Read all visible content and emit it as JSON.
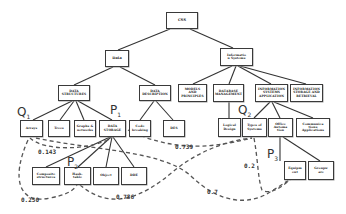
{
  "diagram": {
    "type": "taxonomy-tree-with-weighted-dashed-links",
    "nodes": {
      "root": "CSS",
      "data": "Data",
      "info_systems": "Informatio\nn Systems",
      "data_structures": "DATA\nSTRUCTURES",
      "data_description": "DATA\nDESCRIPTION",
      "models_principles": "MODELS\nAND\nPRINCIPLES",
      "database_mgmt": "DATABASE\nMANAGEMENT",
      "is_application": "INFORMATION\nSYSTEMS\nAPPLICATION",
      "is_storage": "INFORMATION\nSTORAGE AND\nRETRIEVAL",
      "arrays": "Arrays",
      "trees": "Trees",
      "graphs": "Graphs &\nnetworks",
      "data_storage": "DATA\nSTORAGE",
      "code_breaking": "Code\nbreaking",
      "des": "DES",
      "logical_design": "Logical\nDesign",
      "types_of_systems": "Types of\nSystems",
      "office_automation": "Office\nAutoma\ntion",
      "communications_apps": "Communica\ntions\nApplications",
      "composite": "Composite\nstructures",
      "hash_table": "Hash-\ntable",
      "object": "Object",
      "dde": "DDE",
      "equipment": "Equipm\nent",
      "groupware": "Groupw\nare"
    },
    "markers": {
      "q1": {
        "letter": "Q",
        "sub": "1"
      },
      "p1": {
        "letter": "P",
        "sub": "1"
      },
      "p2": {
        "letter": "P",
        "sub": "2"
      },
      "q2": {
        "letter": "Q",
        "sub": "2"
      },
      "p3": {
        "letter": "P",
        "sub": "3"
      }
    },
    "weights": {
      "w1": "0.143",
      "w2": "0.739",
      "w3": "0.250",
      "w4": "0.786",
      "w5": "0.2",
      "w6": "0.7"
    },
    "links": [
      {
        "from": "Arrays (Q1)",
        "to": "DATA STORAGE (P1)",
        "weight": "0.143"
      },
      {
        "from": "DATA STORAGE (P1)",
        "to": "Types of Systems (Q2)",
        "weight": "0.739"
      },
      {
        "from": "Arrays (Q1)",
        "to": "Hash-table (P2)",
        "weight": "0.250"
      },
      {
        "from": "Hash-table (P2)",
        "to": "Types of Systems (Q2)",
        "weight": "0.786"
      },
      {
        "from": "Types of Systems (Q2)",
        "to": "Equipment (P3)",
        "weight": "0.2"
      },
      {
        "from": "Arrays (Q1)",
        "to": "Equipment (P3)",
        "weight": "0.7"
      }
    ],
    "colors": {
      "line": "#333333",
      "dashed": "#555555",
      "box_border": "#3a3a3a"
    }
  }
}
